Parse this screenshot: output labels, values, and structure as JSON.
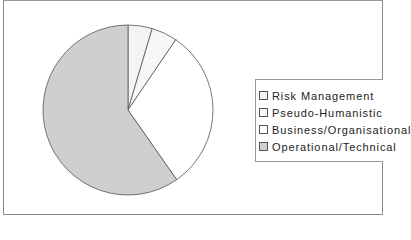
{
  "chart_data": {
    "type": "pie",
    "title": "",
    "categories": [
      "Risk Management",
      "Pseudo-Humanistic",
      "Business/Organisational",
      "Operational/Technical"
    ],
    "values": [
      4.6,
      4.9,
      30.8,
      59.7
    ],
    "colors": [
      "#f4f4f4",
      "#f7f7f7",
      "#ffffff",
      "#cfcfcf"
    ],
    "start_angle_deg": 0,
    "direction": "clockwise",
    "legend_position": "right",
    "unit": "percent (estimated)"
  },
  "legend": {
    "items": [
      {
        "label": "Risk Management",
        "color": "#f4f4f4"
      },
      {
        "label": "Pseudo-Humanistic",
        "color": "#f7f7f7"
      },
      {
        "label": "Business/Organisational",
        "color": "#ffffff"
      },
      {
        "label": "Operational/Technical",
        "color": "#cfcfcf"
      }
    ]
  }
}
